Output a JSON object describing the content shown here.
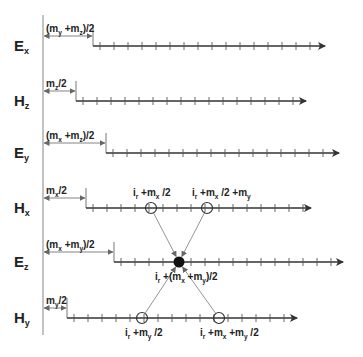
{
  "diagram": {
    "title": "",
    "colors": {
      "line": "#333333",
      "thin": "#888888",
      "text": "#222222"
    },
    "reference_line": {
      "x": 43,
      "y1": 15,
      "y2": 335
    },
    "rows": [
      {
        "id": "Ex",
        "name": "E",
        "sub": "x",
        "y": 46,
        "start": 93,
        "end": 325,
        "offset_label": {
          "pre": "(m",
          "s1": "y",
          "mid": " +m",
          "s2": "z",
          "post": ")/2"
        }
      },
      {
        "id": "Hz",
        "name": "H",
        "sub": "z",
        "y": 101,
        "start": 76,
        "end": 306,
        "offset_label": {
          "pre": "m",
          "s1": "z",
          "mid": "",
          "s2": "",
          "post": "/2"
        }
      },
      {
        "id": "Ey",
        "name": "E",
        "sub": "y",
        "y": 153,
        "start": 106,
        "end": 339,
        "offset_label": {
          "pre": "(m",
          "s1": "x",
          "mid": " +m",
          "s2": "z",
          "post": ")/2"
        }
      },
      {
        "id": "Hx",
        "name": "H",
        "sub": "x",
        "y": 208,
        "start": 86,
        "end": 311,
        "offset_label": {
          "pre": "m",
          "s1": "x",
          "mid": "",
          "s2": "",
          "post": "/2"
        }
      },
      {
        "id": "Ez",
        "name": "E",
        "sub": "z",
        "y": 262,
        "start": 114,
        "end": 343,
        "offset_label": {
          "pre": "(m",
          "s1": "x",
          "mid": " +m",
          "s2": "y",
          "post": ")/2"
        }
      },
      {
        "id": "Hy",
        "name": "H",
        "sub": "y",
        "y": 318,
        "start": 67,
        "end": 297,
        "offset_label": {
          "pre": "m",
          "s1": "y",
          "mid": "",
          "s2": "",
          "post": "/2"
        }
      }
    ],
    "tick_spacing": 14,
    "points": {
      "hx_left": {
        "x": 151,
        "y": 208,
        "label": "i_r +m_x /2"
      },
      "hx_right": {
        "x": 207,
        "y": 208,
        "label": "i_r +m_x /2 +m_y"
      },
      "ez_center": {
        "x": 179,
        "y": 262,
        "label": "i_r +(m_x +m_y)/2"
      },
      "hy_left": {
        "x": 142,
        "y": 318,
        "label": "i_r +m_y /2"
      },
      "hy_right": {
        "x": 219,
        "y": 318,
        "label": "i_r +m_x +m_y /2"
      }
    },
    "annotations": {
      "hx_left": {
        "a": "i",
        "as": "r",
        "b": " +m",
        "bs": "x",
        "c": " /2",
        "cs": "",
        "d": "",
        "ds": "",
        "e": ""
      },
      "hx_right": {
        "a": "i",
        "as": "r",
        "b": " +m",
        "bs": "x",
        "c": " /2 +m",
        "cs": "y",
        "d": "",
        "ds": "",
        "e": ""
      },
      "ez_center": {
        "a": "i",
        "as": "r",
        "b": " +(m",
        "bs": "x",
        "c": " +m",
        "cs": "y",
        "d": ")/2",
        "ds": "",
        "e": ""
      },
      "hy_left": {
        "a": "i",
        "as": "r",
        "b": " +m",
        "bs": "y",
        "c": " /2",
        "cs": "",
        "d": "",
        "ds": "",
        "e": ""
      },
      "hy_right": {
        "a": "i",
        "as": "r",
        "b": " +m",
        "bs": "x",
        "c": " +m",
        "cs": "y",
        "d": " /2",
        "ds": "",
        "e": ""
      }
    }
  }
}
